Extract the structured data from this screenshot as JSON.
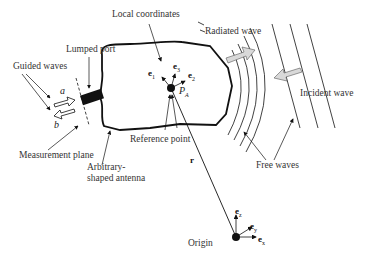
{
  "diagram": {
    "labels": {
      "local_coordinates": "Local coordinates",
      "radiated_wave": "Radiated wave",
      "lumped_port": "Lumped port",
      "guided_waves": "Guided  waves",
      "incident_wave": "Incident wave",
      "measurement_plane": "Measurement plane",
      "reference_point": "Reference point",
      "antenna_line1": "Arbitrary-",
      "antenna_line2": "shaped antenna",
      "free_waves": "Free waves",
      "origin": "Origin",
      "position_vector": "r"
    },
    "symbols": {
      "a": "a",
      "b": "b",
      "PA": "P",
      "PA_sub": "A",
      "e1": "e",
      "e1_sub": "1",
      "e2": "e",
      "e2_sub": "2",
      "e3": "e",
      "e3_sub": "3",
      "ex": "e",
      "ex_sub": "x",
      "ey": "e",
      "ey_sub": "y",
      "ez": "e",
      "ez_sub": "z"
    },
    "colors": {
      "line": "#111111",
      "arrow_fill": "#d9d9d9",
      "text": "#333333"
    }
  }
}
